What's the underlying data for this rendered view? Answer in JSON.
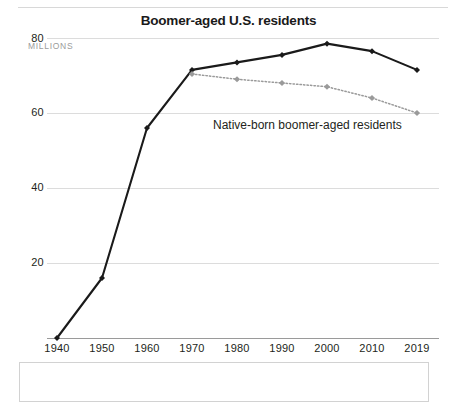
{
  "chart_data": {
    "type": "line",
    "title": "Boomer-aged U.S. residents",
    "xlabel": "",
    "ylabel": "MILLIONS",
    "ylim": [
      0,
      80
    ],
    "yticks": [
      20,
      40,
      60,
      80
    ],
    "grid": true,
    "legend_position": "inline-annotation",
    "categories": [
      "1940",
      "1950",
      "1960",
      "1970",
      "1980",
      "1990",
      "2000",
      "2010",
      "2019"
    ],
    "x": [
      1940,
      1950,
      1960,
      1970,
      1980,
      1990,
      2000,
      2010,
      2019
    ],
    "series": [
      {
        "name": "Boomer-aged U.S. residents",
        "style": "solid",
        "color": "#1a1a1a",
        "marker": "diamond",
        "values": [
          0,
          16,
          56,
          71.5,
          73.5,
          75.5,
          78.5,
          76.5,
          71.5
        ]
      },
      {
        "name": "Native-born boomer-aged residents",
        "style": "dotted",
        "color": "#9a9a9a",
        "marker": "diamond",
        "values": [
          null,
          null,
          null,
          70.4,
          69,
          68,
          67,
          64,
          60
        ]
      }
    ],
    "annotations": [
      {
        "text": "Native-born boomer-aged residents",
        "x": 1980,
        "y": 47
      }
    ]
  },
  "axis": {
    "y_labels": [
      "80",
      "60",
      "40",
      "20"
    ],
    "units": "MILLIONS",
    "x_labels": [
      "1940",
      "1950",
      "1960",
      "1970",
      "1980",
      "1990",
      "2000",
      "2010",
      "2019"
    ]
  },
  "colors": {
    "primary_line": "#1a1a1a",
    "secondary_line": "#9a9a9a",
    "gridline": "#dcdcdc",
    "axisline": "#9a9a9a",
    "text": "#231f20",
    "units_text": "#9b9b9b"
  }
}
